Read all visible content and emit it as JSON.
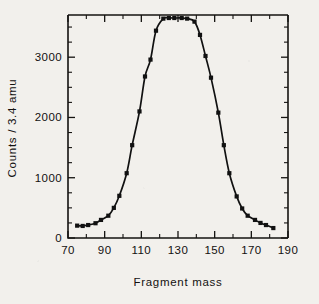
{
  "chart_data": {
    "type": "line",
    "title": "",
    "xlabel": "Fragment mass",
    "ylabel": "Counts / 3.4 amu",
    "xlim": [
      70,
      190
    ],
    "ylim": [
      0,
      3700
    ],
    "grid": false,
    "legend": "none",
    "marker": "square",
    "xticks": [
      70,
      90,
      110,
      130,
      150,
      170,
      190
    ],
    "xtick_labels": [
      "70",
      "90",
      "110",
      "130",
      "150",
      "170",
      "190"
    ],
    "x_minor_tick_interval": 10,
    "yticks": [
      0,
      1000,
      2000,
      3000
    ],
    "ytick_labels": [
      "0",
      "1000",
      "2000",
      "3000"
    ],
    "y_minor_tick_interval": 250,
    "x": [
      75,
      78,
      81,
      85,
      88,
      92,
      95,
      98,
      102,
      105,
      109,
      112,
      115,
      118,
      122,
      125,
      128,
      132,
      135,
      139,
      142,
      145,
      148,
      152,
      155,
      158,
      162,
      165,
      168,
      172,
      175,
      178,
      182
    ],
    "values": [
      205,
      200,
      215,
      245,
      300,
      370,
      500,
      700,
      1075,
      1540,
      2100,
      2680,
      2960,
      3440,
      3640,
      3650,
      3650,
      3650,
      3640,
      3590,
      3370,
      3020,
      2660,
      2080,
      1540,
      1075,
      690,
      490,
      370,
      300,
      250,
      215,
      165
    ],
    "series": [
      {
        "name": "fragment mass yield",
        "values": [
          205,
          200,
          215,
          245,
          300,
          370,
          500,
          700,
          1075,
          1540,
          2100,
          2680,
          2960,
          3440,
          3640,
          3650,
          3650,
          3650,
          3640,
          3590,
          3370,
          3020,
          2660,
          2080,
          1540,
          1075,
          690,
          490,
          370,
          300,
          250,
          215,
          165
        ]
      }
    ]
  },
  "figure": {
    "x_axis_title": "Fragment mass",
    "y_axis_title": "Counts / 3.4 amu"
  },
  "colors": {
    "ink": "#151311",
    "paper": "#f2f0ec"
  }
}
